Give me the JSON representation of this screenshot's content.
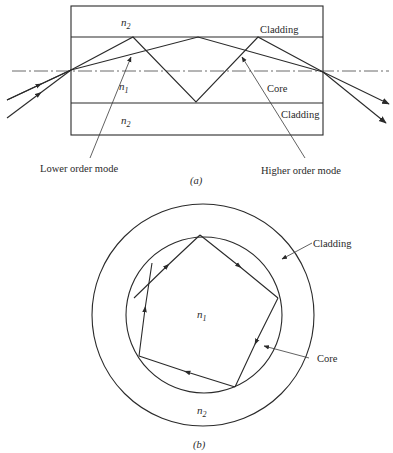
{
  "figure_a": {
    "caption": "(a)",
    "labels": {
      "n2_top": "n",
      "n2_top_sub": "2",
      "n1": "n",
      "n1_sub": "1",
      "n2_bottom": "n",
      "n2_bottom_sub": "2",
      "cladding_top": "Cladding",
      "core": "Core",
      "cladding_bottom": "Cladding",
      "lower_order_mode": "Lower order mode",
      "higher_order_mode": "Higher order mode"
    }
  },
  "figure_b": {
    "caption": "(b)",
    "labels": {
      "n1": "n",
      "n1_sub": "1",
      "n2": "n",
      "n2_sub": "2",
      "cladding": "Cladding",
      "core": "Core"
    }
  },
  "colors": {
    "line": "#2a2a2a",
    "background": "#ffffff"
  }
}
